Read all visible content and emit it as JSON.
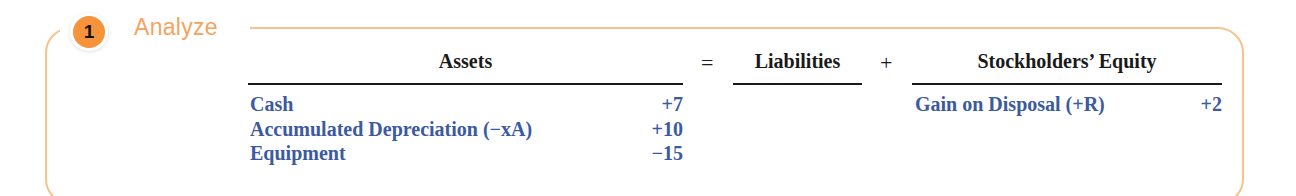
{
  "step": {
    "number": "1",
    "title": "Analyze"
  },
  "equation": {
    "assets_header": "Assets",
    "equals": "=",
    "liabilities_header": "Liabilities",
    "plus": "+",
    "equity_header": "Stockholders’ Equity"
  },
  "assets": [
    {
      "account": "Cash",
      "amount": "+7"
    },
    {
      "account": "Accumulated Depreciation (−xA)",
      "amount": "+10"
    },
    {
      "account": "Equipment",
      "amount": "−15"
    }
  ],
  "equity": [
    {
      "account": "Gain on Disposal (+R)",
      "amount": "+2"
    }
  ],
  "colors": {
    "accent": "#f7933a",
    "border": "#f7c38a",
    "entry_text": "#3b5aa0"
  }
}
